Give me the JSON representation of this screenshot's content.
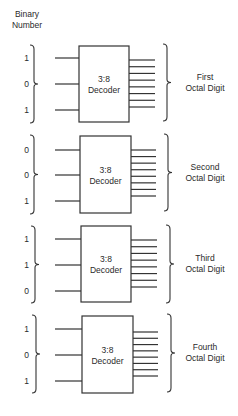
{
  "header": {
    "title_line1": "Binary",
    "title_line2": "Number"
  },
  "colors": {
    "line": "#333333",
    "text": "#2a2a2a",
    "background": "#ffffff"
  },
  "decoders": [
    {
      "label_line1": "3:8",
      "label_line2": "Decoder",
      "inputs": [
        "1",
        "0",
        "1"
      ],
      "output_count": 8,
      "output_line1": "First",
      "output_line2": "Octal Digit",
      "box": {
        "x": 79,
        "y": 46,
        "w": 50,
        "h": 76
      },
      "input_y": [
        58,
        84,
        110
      ],
      "out_y0": 60,
      "out_y1": 107,
      "out_x1": 155,
      "lbrace": {
        "x": 34,
        "y0": 45,
        "y1": 123
      },
      "rbrace": {
        "x": 167,
        "y0": 44,
        "y1": 121
      }
    },
    {
      "label_line1": "3:8",
      "label_line2": "Decoder",
      "inputs": [
        "0",
        "0",
        "1"
      ],
      "output_count": 8,
      "output_line1": "Second",
      "output_line2": "Octal Digit",
      "box": {
        "x": 80,
        "y": 136,
        "w": 51,
        "h": 77
      },
      "input_y": [
        150,
        175,
        201
      ],
      "out_y0": 150,
      "out_y1": 196,
      "out_x1": 156,
      "lbrace": {
        "x": 34,
        "y0": 135,
        "y1": 214
      },
      "rbrace": {
        "x": 168,
        "y0": 134,
        "y1": 211
      }
    },
    {
      "label_line1": "3:8",
      "label_line2": "Decoder",
      "inputs": [
        "1",
        "1",
        "0"
      ],
      "output_count": 8,
      "output_line1": "Third",
      "output_line2": "Octal Digit",
      "box": {
        "x": 81,
        "y": 226,
        "w": 50,
        "h": 76
      },
      "input_y": [
        239,
        265,
        291
      ],
      "out_y0": 240,
      "out_y1": 287,
      "out_x1": 157,
      "lbrace": {
        "x": 35,
        "y0": 226,
        "y1": 303
      },
      "rbrace": {
        "x": 170,
        "y0": 225,
        "y1": 303
      }
    },
    {
      "label_line1": "3:8",
      "label_line2": "Decoder",
      "inputs": [
        "1",
        "0",
        "1"
      ],
      "output_count": 8,
      "output_line1": "Fourth",
      "output_line2": "Octal Digit",
      "box": {
        "x": 82,
        "y": 316,
        "w": 51,
        "h": 77
      },
      "input_y": [
        329,
        355,
        381
      ],
      "out_y0": 332,
      "out_y1": 376,
      "out_x1": 158,
      "lbrace": {
        "x": 36,
        "y0": 315,
        "y1": 393
      },
      "rbrace": {
        "x": 171,
        "y0": 314,
        "y1": 392
      }
    }
  ]
}
